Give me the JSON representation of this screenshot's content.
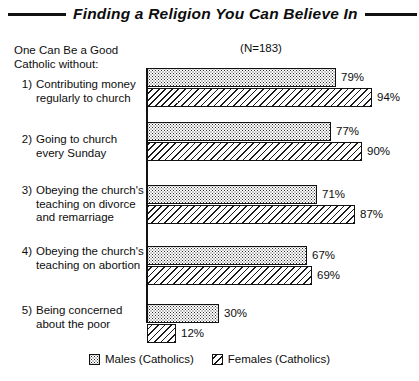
{
  "header": {
    "title": "Finding a Religion You Can Believe In",
    "sample_size": "(N=183)",
    "question_stem": "One Can Be a Good Catholic without:"
  },
  "legend": {
    "items": [
      {
        "label": "Males (Catholics)",
        "pattern": "dotted-swatch-icon"
      },
      {
        "label": "Females (Catholics)",
        "pattern": "hatched-swatch-icon"
      }
    ]
  },
  "chart_data": {
    "type": "bar",
    "orientation": "horizontal",
    "title": "Finding a Religion You Can Believe In",
    "subtitle": "One Can Be a Good Catholic without:",
    "annotations": [
      "(N=183)"
    ],
    "xlabel": "",
    "ylabel": "",
    "xlim": [
      0,
      100
    ],
    "grid": false,
    "legend_position": "bottom-center",
    "value_suffix": "%",
    "categories": [
      "1) Contributing money regularly to church",
      "2) Going to church every Sunday",
      "3) Obeying the church's teaching on divorce and remarriage",
      "4) Obeying the church's teaching on abortion",
      "5) Being concerned about the poor"
    ],
    "category_numbers": [
      "1)",
      "2)",
      "3)",
      "4)",
      "5)"
    ],
    "category_texts": [
      "Contributing money regularly to church",
      "Going to church every Sunday",
      "Obeying the church's teaching on divorce and remarriage",
      "Obeying the church's teaching on abortion",
      "Being concerned about the poor"
    ],
    "series": [
      {
        "name": "Males (Catholics)",
        "values": [
          79,
          77,
          71,
          67,
          30
        ],
        "labels": [
          "79%",
          "77%",
          "71%",
          "67%",
          "30%"
        ]
      },
      {
        "name": "Females (Catholics)",
        "values": [
          94,
          90,
          87,
          69,
          12
        ],
        "labels": [
          "94%",
          "90%",
          "87%",
          "69%",
          "12%"
        ]
      }
    ]
  }
}
